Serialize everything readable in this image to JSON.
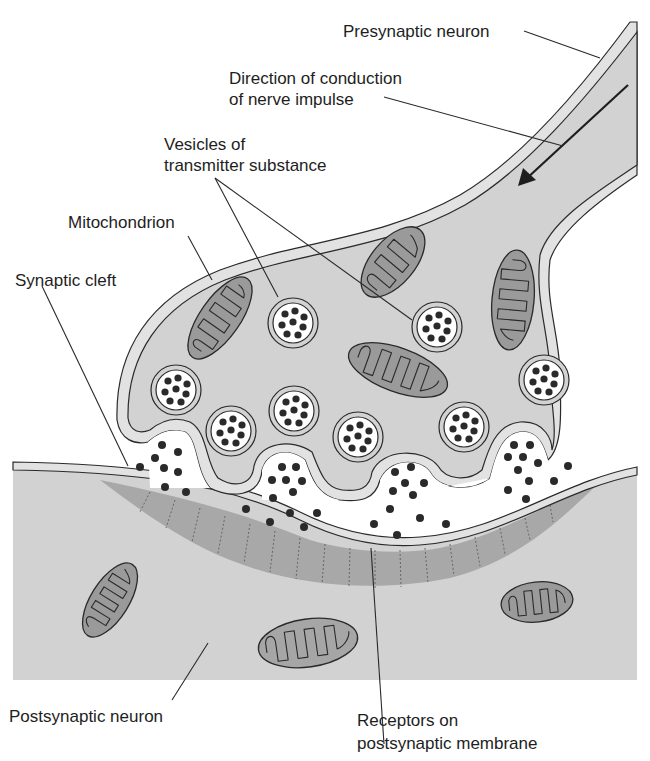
{
  "diagram": {
    "type": "anatomical-illustration",
    "colors": {
      "background": "#ffffff",
      "cytoplasm": "#d2d2d2",
      "membrane_band": "#e2e2e2",
      "outline": "#2a2a2a",
      "mitochondrion_fill": "#9a9a9a",
      "receptor_zone": "#a8a8a8",
      "vesicle_interior": "#ffffff",
      "neurotransmitter_dot": "#2a2a2a",
      "label_text": "#1e1e1e"
    },
    "labels": {
      "presynaptic_neuron": "Presynaptic neuron",
      "direction_line1": "Direction of conduction",
      "direction_line2": "of nerve impulse",
      "vesicles_line1": "Vesicles of",
      "vesicles_line2": "transmitter substance",
      "mitochondrion": "Mitochondrion",
      "synaptic_cleft": "Synaptic cleft",
      "postsynaptic_neuron": "Postsynaptic neuron",
      "receptors_line1": "Receptors on",
      "receptors_line2": "postsynaptic membrane"
    },
    "icons": {
      "impulse_arrow": "arrow-down-left-icon"
    },
    "counts": {
      "vesicles_in_terminal": 10,
      "vesicles_fusing_with_membrane": 4,
      "presynaptic_mitochondria": 4,
      "postsynaptic_mitochondria": 3
    }
  }
}
